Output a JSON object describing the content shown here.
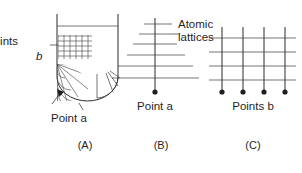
{
  "figure": {
    "background_color": "#ffffff",
    "ink_color": "#1f1f1f",
    "width": 302,
    "height": 173
  },
  "labels": {
    "points_b_left_line1": "Points",
    "points_b_left_line2": "b",
    "point_a_lower": "Point a",
    "atomic_lattices_line1": "Atomic",
    "atomic_lattices_line2": "lattices",
    "point_a_panel_b": "Point a",
    "points_b_panel_c": "Points b"
  },
  "captions": {
    "panel_a": "(A)",
    "panel_b": "(B)",
    "panel_c": "(C)"
  },
  "panels": [
    {
      "id": "A",
      "caption": "(A)",
      "description": "U-shaped vessel outline with liquid surface line, rectangular cross-hatch grid at upper left, radial fan mesh at lower left, radial spokes at lower right",
      "features": {
        "vessel_left_wall_x": 57,
        "vessel_right_wall_x": 118,
        "vessel_top_y": 14,
        "vessel_bottom_y": 101,
        "liquid_line_y": 26,
        "rect_grid_columns": 6,
        "rect_grid_rows": 5,
        "fan_radial_spokes": 6,
        "fan_arc_rings": 5,
        "right_spokes": 4
      }
    },
    {
      "id": "B",
      "caption": "(B)",
      "description": "Single vertical lattice line with horizontal cross lines increasing in length toward the bottom, terminating in a point dot",
      "features": {
        "axis_x": 155,
        "axis_top_y": 18,
        "axis_bottom_y": 92,
        "cross_line_count": 6,
        "cross_line_half_widths": [
          11,
          16,
          22,
          30,
          40,
          48
        ],
        "point_dot_y": 92
      }
    },
    {
      "id": "C",
      "caption": "(C)",
      "description": "Square lattice grid of four vertical lines crossed by four horizontal lines with point dots at the base of each vertical line",
      "features": {
        "vertical_count": 4,
        "horizontal_count": 4,
        "vertical_xs": [
          222,
          243,
          264,
          285
        ],
        "horizontal_ys": [
          38,
          52,
          66,
          80
        ],
        "grid_top_y": 27,
        "dot_y": 92
      }
    }
  ],
  "colors": {
    "ink": "#1f1f1f",
    "line": "#2b2b2b",
    "grid": "#4a4a4a",
    "background": "#ffffff"
  }
}
